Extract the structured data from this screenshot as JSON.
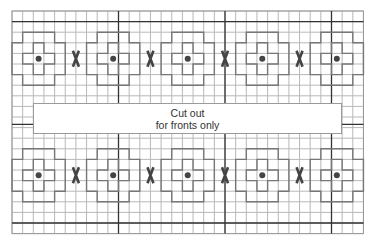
{
  "diagram": {
    "type": "knitting-chart",
    "grid": {
      "cols": 33,
      "rows": 21,
      "origin_x": 12,
      "origin_y": 11,
      "cell_w": 10.65,
      "cell_h": 10.6,
      "thick_cols": [
        10,
        20,
        30
      ],
      "thick_rows_top": 1,
      "thick_rows_side": 10.7,
      "thick_rows_bottom": 20,
      "line_color": "#b8b8b8",
      "thick_color": "#333333",
      "motif_color": "#777777"
    },
    "motif_rows": [
      4,
      15
    ],
    "dot_cols": [
      2,
      9,
      16,
      23,
      30
    ],
    "x_mark_cols": [
      6,
      13,
      20,
      27
    ],
    "cutout": {
      "line1": "Cut out",
      "line2": "for fronts only"
    }
  }
}
